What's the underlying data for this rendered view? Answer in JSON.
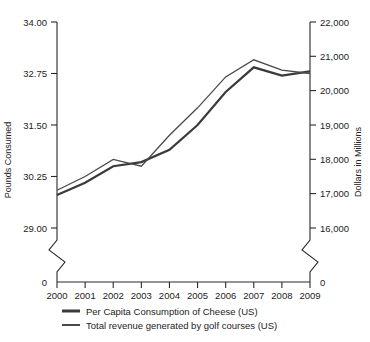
{
  "chart_data": {
    "type": "line",
    "title": "",
    "subtitle": "",
    "xlabel": "",
    "ylabel": "Pounds Consumed",
    "y2label": "Dollars in Millions",
    "grid": false,
    "legend_position": "bottom",
    "axis_break": true,
    "categories": [
      "2000",
      "2001",
      "2002",
      "2003",
      "2004",
      "2005",
      "2006",
      "2007",
      "2008",
      "2009"
    ],
    "x": [
      2000,
      2001,
      2002,
      2003,
      2004,
      2005,
      2006,
      2007,
      2008,
      2009
    ],
    "ylim": [
      29.0,
      34.0
    ],
    "yticks": [
      29.0,
      30.25,
      31.5,
      32.75,
      34.0
    ],
    "ytick_labels": [
      "29.00",
      "30.25",
      "31.50",
      "32.75",
      "34.00"
    ],
    "y_zero_label": "0",
    "y2lim": [
      16000,
      22000
    ],
    "y2ticks": [
      16000,
      17000,
      18000,
      19000,
      20000,
      21000,
      22000
    ],
    "y2tick_labels": [
      "16,000",
      "17,000",
      "18,000",
      "19,000",
      "20,000",
      "21,000",
      "22,000"
    ],
    "y2_zero_label": "0",
    "series": [
      {
        "name": "Per Capita Consumption of Cheese (US)",
        "axis": "left",
        "color": "#3a3a3a",
        "stroke_width": 2.2,
        "values": [
          29.8,
          30.1,
          30.5,
          30.6,
          30.9,
          31.5,
          32.3,
          32.9,
          32.7,
          32.8
        ]
      },
      {
        "name": "Total revenue generated by golf courses (US)",
        "axis": "right",
        "color": "#4a4a4a",
        "stroke_width": 1.3,
        "values": [
          17100,
          17500,
          18000,
          17800,
          18700,
          19500,
          20400,
          20900,
          20600,
          20500
        ]
      }
    ],
    "legend": [
      {
        "label": "Per Capita Consumption of Cheese (US)",
        "color": "#3a3a3a",
        "stroke_width": 3.0
      },
      {
        "label": "Total revenue generated by golf courses (US)",
        "color": "#4a4a4a",
        "stroke_width": 2.0
      }
    ]
  }
}
